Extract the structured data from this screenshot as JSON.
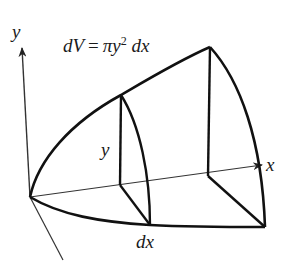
{
  "diagram": {
    "formula": {
      "lhs": "dV",
      "equals": "=",
      "pi": "π",
      "var": "y",
      "exponent": "2",
      "differential": "dx"
    },
    "labels": {
      "y_axis": "y",
      "x_axis": "x",
      "radius": "y",
      "thickness": "dx"
    },
    "colors": {
      "stroke": "#111111",
      "axis": "#333333",
      "text": "#1a1a1a",
      "background": "#ffffff"
    }
  }
}
